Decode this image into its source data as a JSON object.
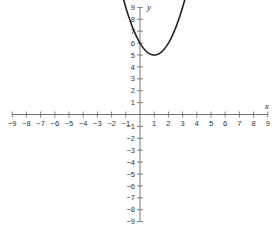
{
  "chart_data": {
    "type": "line",
    "title": "",
    "xlabel": "x",
    "ylabel": "y",
    "xlim": [
      -9,
      9
    ],
    "ylim": [
      -9,
      9
    ],
    "grid": false,
    "x_ticks": [
      -9,
      -8,
      -7,
      -6,
      -5,
      -4,
      -3,
      -2,
      -1,
      1,
      2,
      3,
      4,
      5,
      6,
      7,
      8,
      9
    ],
    "y_ticks": [
      -9,
      -8,
      -7,
      -6,
      -5,
      -4,
      -3,
      -2,
      -1,
      1,
      2,
      3,
      4,
      5,
      6,
      7,
      8,
      9
    ],
    "series": [
      {
        "name": "parabola",
        "equation": "y = (x - 1)^2 + 5",
        "vertex": [
          1,
          5
        ],
        "x": [
          -1,
          -0.5,
          0,
          0.5,
          1,
          1.5,
          2,
          2.5,
          3
        ],
        "y": [
          9,
          7.25,
          6,
          5.25,
          5,
          5.25,
          6,
          7.25,
          9
        ]
      }
    ]
  },
  "colors": {
    "axis": "#555555",
    "curve": "#222222"
  }
}
